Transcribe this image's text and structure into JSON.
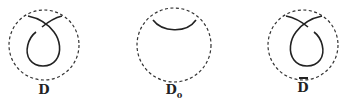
{
  "diagrams": [
    {
      "id": "D",
      "label": "D",
      "subscript": "",
      "overline": false,
      "description": "kink with crossing, left strand over"
    },
    {
      "id": "D0",
      "label": "D",
      "subscript": "0",
      "overline": false,
      "description": "smoothed arc"
    },
    {
      "id": "Dbar",
      "label": "D",
      "subscript": "",
      "overline": true,
      "description": "kink with crossing, right strand over (mirror)"
    }
  ],
  "colors": {
    "stroke": "#222222",
    "dashed": "#333333",
    "background": "#ffffff"
  }
}
